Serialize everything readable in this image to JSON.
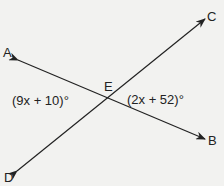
{
  "diagram": {
    "type": "intersecting-lines",
    "points": {
      "A": "A",
      "B": "B",
      "C": "C",
      "D": "D",
      "E": "E"
    },
    "angles": {
      "AED": "(9x + 10)°",
      "CEB": "(2x + 52)°"
    },
    "colors": {
      "line": "#222222",
      "background": "#f2f2f0"
    }
  }
}
